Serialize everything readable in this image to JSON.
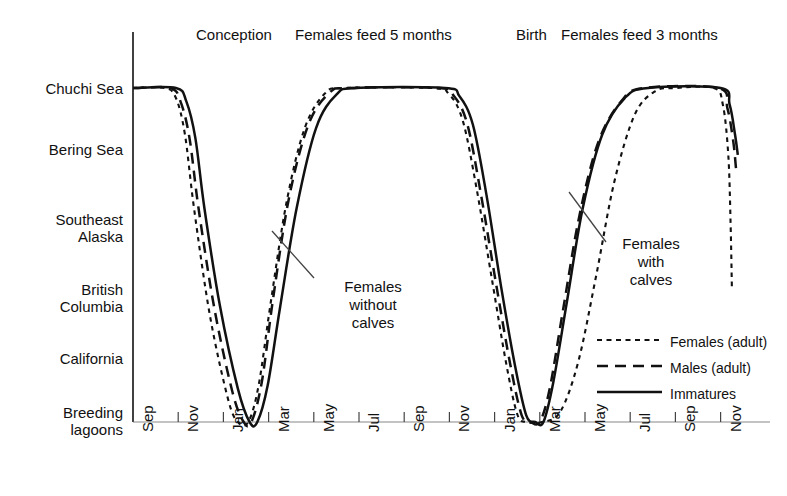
{
  "chart_data": {
    "type": "line",
    "title": "",
    "xlabel": "",
    "ylabel": "",
    "grid": false,
    "legend_position": "bottom-right",
    "y_categories": [
      "Chuchi Sea",
      "Bering Sea",
      "Southeast Alaska",
      "British Columbia",
      "California",
      "Breeding lagoons"
    ],
    "y_levels": [
      5,
      4,
      3,
      2,
      1,
      0
    ],
    "x_tick_labels": [
      "Sep",
      "Nov",
      "Jan",
      "Mar",
      "May",
      "Jul",
      "Sep",
      "Nov",
      "Jan",
      "Mar",
      "May",
      "Jul",
      "Sep",
      "Nov"
    ],
    "annotations": [
      {
        "text": "Conception",
        "x_tick": "Dec (year 1)",
        "position": "top"
      },
      {
        "text": "Females feed 5 months",
        "x_tick": "May-Sep (year 1)",
        "position": "top"
      },
      {
        "text": "Birth",
        "x_tick": "Jan (year 2)",
        "position": "top"
      },
      {
        "text": "Females feed 3 months",
        "x_tick": "Jul-Oct (year 2)",
        "position": "top"
      },
      {
        "text": "Females without calves",
        "position": "inline",
        "points_to": "females-ascent-first-migration"
      },
      {
        "text": "Females with calves",
        "position": "inline",
        "points_to": "females-ascent-second-migration"
      }
    ],
    "series": [
      {
        "name": "Females (adult)",
        "style": "dotted",
        "points": [
          [
            0.0,
            5.0
          ],
          [
            0.7,
            5.0
          ],
          [
            0.95,
            4.85
          ],
          [
            1.15,
            4.3
          ],
          [
            1.35,
            3.2
          ],
          [
            1.7,
            1.6
          ],
          [
            2.1,
            0.35
          ],
          [
            2.32,
            0.0
          ],
          [
            2.55,
            0.0
          ],
          [
            2.78,
            0.55
          ],
          [
            3.05,
            1.8
          ],
          [
            3.4,
            3.3
          ],
          [
            3.8,
            4.4
          ],
          [
            4.25,
            4.92
          ],
          [
            4.7,
            5.0
          ],
          [
            6.6,
            5.0
          ],
          [
            7.0,
            4.9
          ],
          [
            7.3,
            4.5
          ],
          [
            7.6,
            3.5
          ],
          [
            7.95,
            2.1
          ],
          [
            8.25,
            0.9
          ],
          [
            8.5,
            0.12
          ],
          [
            8.7,
            0.0
          ],
          [
            9.05,
            0.0
          ],
          [
            9.45,
            0.15
          ],
          [
            9.85,
            0.9
          ],
          [
            10.25,
            2.2
          ],
          [
            10.65,
            3.6
          ],
          [
            11.1,
            4.6
          ],
          [
            11.55,
            4.95
          ],
          [
            12.0,
            5.0
          ],
          [
            12.85,
            5.0
          ],
          [
            13.05,
            4.75
          ],
          [
            13.17,
            4.0
          ],
          [
            13.22,
            3.0
          ],
          [
            13.25,
            2.0
          ]
        ]
      },
      {
        "name": "Males (adult)",
        "style": "dashed",
        "points": [
          [
            0.0,
            5.0
          ],
          [
            0.82,
            5.0
          ],
          [
            1.05,
            4.8
          ],
          [
            1.25,
            4.25
          ],
          [
            1.45,
            3.2
          ],
          [
            1.8,
            1.7
          ],
          [
            2.2,
            0.45
          ],
          [
            2.45,
            0.0
          ],
          [
            2.62,
            0.0
          ],
          [
            2.85,
            0.6
          ],
          [
            3.1,
            1.85
          ],
          [
            3.45,
            3.35
          ],
          [
            3.88,
            4.45
          ],
          [
            4.35,
            4.93
          ],
          [
            4.8,
            5.0
          ],
          [
            6.75,
            5.0
          ],
          [
            7.1,
            4.88
          ],
          [
            7.4,
            4.45
          ],
          [
            7.7,
            3.4
          ],
          [
            8.05,
            2.0
          ],
          [
            8.35,
            0.85
          ],
          [
            8.6,
            0.1
          ],
          [
            8.8,
            0.0
          ],
          [
            9.0,
            0.0
          ],
          [
            9.22,
            0.5
          ],
          [
            9.52,
            1.7
          ],
          [
            9.88,
            3.1
          ],
          [
            10.3,
            4.2
          ],
          [
            10.8,
            4.8
          ],
          [
            11.3,
            5.0
          ],
          [
            12.95,
            5.0
          ],
          [
            13.15,
            4.7
          ],
          [
            13.28,
            4.2
          ],
          [
            13.34,
            3.8
          ]
        ]
      },
      {
        "name": "Immatures",
        "style": "solid",
        "points": [
          [
            0.0,
            5.0
          ],
          [
            0.95,
            5.0
          ],
          [
            1.18,
            4.8
          ],
          [
            1.38,
            4.25
          ],
          [
            1.58,
            3.2
          ],
          [
            1.92,
            1.75
          ],
          [
            2.32,
            0.5
          ],
          [
            2.58,
            0.0
          ],
          [
            2.75,
            0.0
          ],
          [
            2.98,
            0.55
          ],
          [
            3.25,
            1.7
          ],
          [
            3.62,
            3.2
          ],
          [
            4.05,
            4.4
          ],
          [
            4.5,
            4.9
          ],
          [
            4.95,
            5.0
          ],
          [
            6.9,
            5.0
          ],
          [
            7.22,
            4.88
          ],
          [
            7.52,
            4.45
          ],
          [
            7.82,
            3.4
          ],
          [
            8.15,
            2.0
          ],
          [
            8.45,
            0.85
          ],
          [
            8.7,
            0.1
          ],
          [
            8.9,
            0.0
          ],
          [
            9.08,
            0.0
          ],
          [
            9.3,
            0.6
          ],
          [
            9.6,
            1.8
          ],
          [
            9.95,
            3.2
          ],
          [
            10.38,
            4.3
          ],
          [
            10.88,
            4.85
          ],
          [
            11.4,
            5.0
          ],
          [
            13.0,
            5.0
          ],
          [
            13.2,
            4.75
          ],
          [
            13.32,
            4.3
          ],
          [
            13.38,
            4.0
          ]
        ]
      }
    ]
  },
  "axis": {
    "y_labels": [
      {
        "label": "Chuchi Sea"
      },
      {
        "label": "Bering Sea"
      },
      {
        "label": "Southeast\nAlaska",
        "line1": "Southeast",
        "line2": "Alaska"
      },
      {
        "label": "British\nColumbia",
        "line1": "British",
        "line2": "Columbia"
      },
      {
        "label": "California"
      },
      {
        "label": "Breeding\nlagoons",
        "line1": "Breeding",
        "line2": "lagoons"
      }
    ],
    "x_labels": [
      "Sep",
      "Nov",
      "Jan",
      "Mar",
      "May",
      "Jul",
      "Sep",
      "Nov",
      "Jan",
      "Mar",
      "May",
      "Jul",
      "Sep",
      "Nov"
    ]
  },
  "top_annotations": [
    {
      "text": "Conception"
    },
    {
      "text": "Females feed 5 months"
    },
    {
      "text": "Birth"
    },
    {
      "text": "Females feed 3 months"
    }
  ],
  "inline_annotations": [
    {
      "line1": "Females",
      "line2": "without",
      "line3": "calves"
    },
    {
      "line1": "Females",
      "line2": "with",
      "line3": "calves"
    }
  ],
  "legend": {
    "items": [
      {
        "label": "Females (adult)",
        "style": "dotted"
      },
      {
        "label": "Males (adult)",
        "style": "dashed"
      },
      {
        "label": "Immatures",
        "style": "solid"
      }
    ]
  },
  "colors": {
    "ink": "#111111",
    "background": "#ffffff"
  }
}
